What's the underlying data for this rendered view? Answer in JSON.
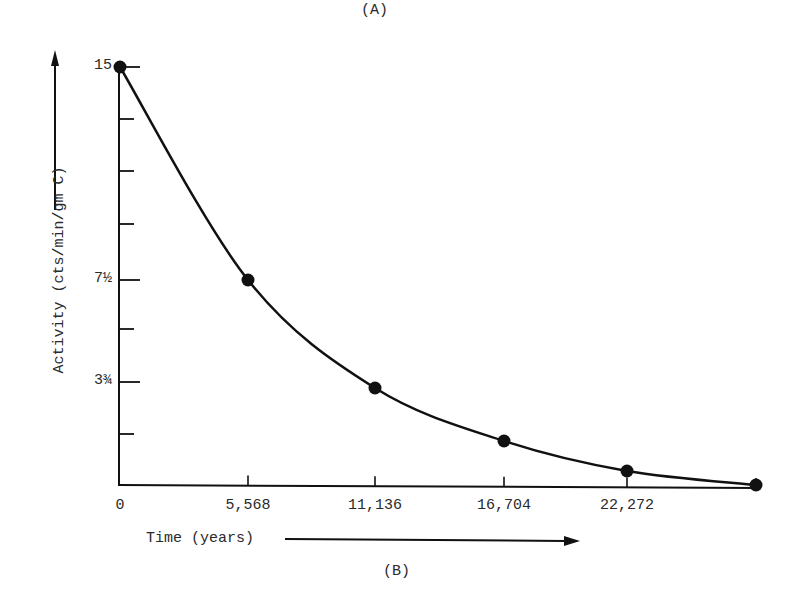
{
  "figure": {
    "top_label": "(A)",
    "bottom_label": "(B)"
  },
  "axes": {
    "ylabel": "Activity (cts/min/gm C)",
    "xlabel": "Time (years)",
    "y_ticks": [
      {
        "label": "15",
        "y": 67
      },
      {
        "label": "",
        "y": 119
      },
      {
        "label": "",
        "y": 171
      },
      {
        "label": "",
        "y": 224
      },
      {
        "label": "7½",
        "y": 280
      },
      {
        "label": "",
        "y": 329
      },
      {
        "label": "3¾",
        "y": 382
      },
      {
        "label": "",
        "y": 434
      }
    ],
    "x_ticks": [
      {
        "label": "0",
        "x": 120
      },
      {
        "label": "5,568",
        "x": 248
      },
      {
        "label": "11,136",
        "x": 375
      },
      {
        "label": "16,704",
        "x": 504
      },
      {
        "label": "22,272",
        "x": 627
      },
      {
        "label": "",
        "x": 756
      }
    ]
  },
  "chart_data": {
    "type": "line",
    "title": "",
    "xlabel": "Time (years)",
    "ylabel": "Activity (cts/min/gm C)",
    "x": [
      0,
      5568,
      11136,
      16704,
      22272,
      27840
    ],
    "values": [
      15,
      7.5,
      3.75,
      1.875,
      0.9375,
      0.46875
    ],
    "x_tick_labels": [
      "0",
      "5,568",
      "11,136",
      "16,704",
      "22,272"
    ],
    "y_tick_labels": [
      "15",
      "7½",
      "3¾"
    ],
    "annotations": [
      "(A)",
      "(B)"
    ],
    "grid": false,
    "legend": null,
    "points_px": [
      [
        120,
        67
      ],
      [
        248,
        280
      ],
      [
        375,
        388
      ],
      [
        504,
        441
      ],
      [
        627,
        471
      ],
      [
        756,
        485
      ]
    ]
  }
}
